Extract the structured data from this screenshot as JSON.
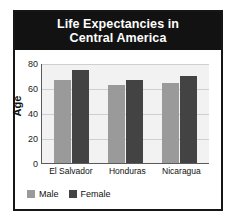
{
  "chart_data": {
    "type": "bar",
    "title": "Life Expectancies in Central America",
    "title_line1": "Life Expectancies in",
    "title_line2": "Central America",
    "xlabel": "",
    "ylabel": "Age",
    "categories": [
      "El Salvador",
      "Honduras",
      "Nicaragua"
    ],
    "series": [
      {
        "name": "Male",
        "values": [
          67,
          63,
          65
        ],
        "color": "#9a9a9a"
      },
      {
        "name": "Female",
        "values": [
          75,
          67,
          70
        ],
        "color": "#434343"
      }
    ],
    "ylim": [
      0,
      80
    ],
    "yticks": [
      0,
      20,
      40,
      60,
      80
    ],
    "grid": true,
    "legend_position": "bottom-left",
    "colors": {
      "title_banner": "#121212",
      "title_text": "#ffffff",
      "plot_background": "#f2f2f2",
      "gridline": "#cfcfcf",
      "axis": "#5a5a5a",
      "frame": "#161616"
    }
  }
}
